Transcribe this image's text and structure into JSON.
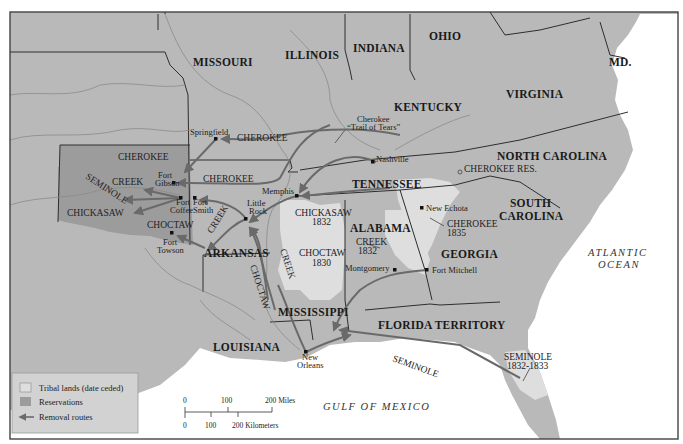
{
  "map": {
    "states": [
      {
        "id": "missouri",
        "label": "MISSOURI",
        "x": 193,
        "y": 66
      },
      {
        "id": "illinois",
        "label": "ILLINOIS",
        "x": 285,
        "y": 59
      },
      {
        "id": "indiana",
        "label": "INDIANA",
        "x": 353,
        "y": 52
      },
      {
        "id": "ohio",
        "label": "OHIO",
        "x": 429,
        "y": 40
      },
      {
        "id": "md",
        "label": "MD.",
        "x": 609,
        "y": 66
      },
      {
        "id": "kentucky",
        "label": "KENTUCKY",
        "x": 394,
        "y": 111
      },
      {
        "id": "virginia",
        "label": "VIRGINIA",
        "x": 506,
        "y": 98
      },
      {
        "id": "north-carolina",
        "label": "NORTH CAROLINA",
        "x": 497,
        "y": 160
      },
      {
        "id": "tennessee",
        "label": "TENNESSEE",
        "x": 352,
        "y": 188
      },
      {
        "id": "south-carolina-1",
        "label": "SOUTH",
        "x": 510,
        "y": 207
      },
      {
        "id": "south-carolina-2",
        "label": "CAROLINA",
        "x": 499,
        "y": 220
      },
      {
        "id": "alabama",
        "label": "ALABAMA",
        "x": 350,
        "y": 232
      },
      {
        "id": "georgia",
        "label": "GEORGIA",
        "x": 441,
        "y": 258
      },
      {
        "id": "arkansas",
        "label": "ARKANSAS",
        "x": 204,
        "y": 257
      },
      {
        "id": "mississippi",
        "label": "MISSISSIPPI",
        "x": 278,
        "y": 316
      },
      {
        "id": "florida-territory",
        "label": "FLORIDA TERRITORY",
        "x": 378,
        "y": 329
      },
      {
        "id": "louisiana",
        "label": "LOUISIANA",
        "x": 213,
        "y": 351
      }
    ],
    "tribes": [
      {
        "id": "cherokee-ok",
        "label": "CHEROKEE",
        "x": 118,
        "y": 160
      },
      {
        "id": "creek-ok",
        "label": "CREEK",
        "x": 112,
        "y": 185
      },
      {
        "id": "chickasaw-ok",
        "label": "CHICKASAW",
        "x": 67,
        "y": 216
      },
      {
        "id": "choctaw-ok",
        "label": "CHOCTAW",
        "x": 147,
        "y": 228
      },
      {
        "id": "chickasaw-1832",
        "label": "CHICKASAW",
        "x": 295,
        "y": 216
      },
      {
        "id": "chickasaw-1832-date",
        "label": "1832",
        "x": 312,
        "y": 225
      },
      {
        "id": "choctaw-1830",
        "label": "CHOCTAW",
        "x": 299,
        "y": 256
      },
      {
        "id": "choctaw-1830-date",
        "label": "1830",
        "x": 312,
        "y": 266
      },
      {
        "id": "creek-1832",
        "label": "CREEK",
        "x": 356,
        "y": 245
      },
      {
        "id": "creek-1832-date",
        "label": "1832",
        "x": 358,
        "y": 254
      },
      {
        "id": "cherokee-1835",
        "label": "CHEROKEE",
        "x": 447,
        "y": 227
      },
      {
        "id": "cherokee-1835-date",
        "label": "1835",
        "x": 447,
        "y": 236
      },
      {
        "id": "cherokee-res",
        "label": "CHEROKEE RES.",
        "x": 464,
        "y": 172
      },
      {
        "id": "seminole-1832",
        "label": "SEMINOLE",
        "x": 504,
        "y": 360
      },
      {
        "id": "seminole-1832-date",
        "label": "1832-1833",
        "x": 507,
        "y": 369
      }
    ],
    "routes": [
      {
        "id": "route-cherokee-springfield",
        "label": "CHEROKEE",
        "x": 237,
        "y": 141
      },
      {
        "id": "route-cherokee-gibson",
        "label": "CHEROKEE",
        "x": 203,
        "y": 182
      },
      {
        "id": "route-cherokee-trail-1",
        "label": "Cherokee",
        "x": 357,
        "y": 122
      },
      {
        "id": "route-cherokee-trail-2",
        "label": "“Trail of Tears”",
        "x": 347,
        "y": 130
      }
    ],
    "rotated_routes": [
      {
        "id": "route-seminole-ok",
        "label": "SEMINOLE",
        "x": 85,
        "y": 178,
        "angle": 33
      },
      {
        "id": "route-creek-ar",
        "label": "CREEK",
        "x": 212,
        "y": 234,
        "angle": -58
      },
      {
        "id": "route-creek-ms",
        "label": "CREEK",
        "x": 280,
        "y": 250,
        "angle": 72
      },
      {
        "id": "route-choctaw-ms",
        "label": "CHOCTAW",
        "x": 250,
        "y": 266,
        "angle": 72
      },
      {
        "id": "route-seminole-gulf",
        "label": "SEMINOLE",
        "x": 392,
        "y": 361,
        "angle": 20
      }
    ],
    "cities": [
      {
        "id": "springfield",
        "label": "Springfield",
        "x": 190,
        "y": 135,
        "dx": 216,
        "dy": 139
      },
      {
        "id": "nashville",
        "label": "Nashville",
        "x": 376,
        "y": 162,
        "dx": 373,
        "dy": 162
      },
      {
        "id": "memphis",
        "label": "Memphis",
        "x": 262,
        "y": 194,
        "dx": 297,
        "dy": 196
      },
      {
        "id": "fort-gibson-1",
        "label": "Fort",
        "x": 158,
        "y": 178,
        "dx": 174,
        "dy": 183
      },
      {
        "id": "fort-gibson-2",
        "label": "Gibson",
        "x": 155,
        "y": 186,
        "dx": null,
        "dy": null
      },
      {
        "id": "fort-coffee-1",
        "label": "Fort",
        "x": 176,
        "y": 201,
        "dx": 181,
        "dy": 198
      },
      {
        "id": "fort-coffee-2",
        "label": "Coffee",
        "x": 170,
        "y": 211,
        "dx": null,
        "dy": null
      },
      {
        "id": "fort-smith-1",
        "label": "Fort",
        "x": 193,
        "y": 201,
        "dx": 195,
        "dy": 198
      },
      {
        "id": "fort-smith-2",
        "label": "Smith",
        "x": 193,
        "y": 211,
        "dx": null,
        "dy": null
      },
      {
        "id": "little-rock-1",
        "label": "Little",
        "x": 247,
        "y": 206,
        "dx": 246,
        "dy": 219
      },
      {
        "id": "little-rock-2",
        "label": "Rock",
        "x": 249,
        "y": 214,
        "dx": null,
        "dy": null
      },
      {
        "id": "fort-towson-1",
        "label": "Fort",
        "x": 163,
        "y": 245,
        "dx": 172,
        "dy": 233
      },
      {
        "id": "fort-towson-2",
        "label": "Towson",
        "x": 157,
        "y": 253,
        "dx": null,
        "dy": null
      },
      {
        "id": "new-echota",
        "label": "New Echota",
        "x": 426,
        "y": 211,
        "dx": 422,
        "dy": 208
      },
      {
        "id": "montgomery",
        "label": "Montgomery",
        "x": 345,
        "y": 271,
        "dx": 395,
        "dy": 270
      },
      {
        "id": "fort-mitchell",
        "label": "Fort Mitchell",
        "x": 432,
        "y": 273,
        "dx": 427,
        "dy": 270
      },
      {
        "id": "new-orleans-1",
        "label": "New",
        "x": 302,
        "y": 359,
        "dx": 306,
        "dy": 352
      },
      {
        "id": "new-orleans-2",
        "label": "Orleans",
        "x": 297,
        "y": 367,
        "dx": null,
        "dy": null
      }
    ],
    "water": [
      {
        "id": "atlantic-ocean-1",
        "label": "ATLANTIC",
        "x": 588,
        "y": 256
      },
      {
        "id": "atlantic-ocean-2",
        "label": "OCEAN",
        "x": 598,
        "y": 268
      },
      {
        "id": "gulf-of-mexico",
        "label": "GULF OF MEXICO",
        "x": 323,
        "y": 410
      }
    ]
  },
  "legend": {
    "items": [
      {
        "id": "tribal-lands",
        "label": "Tribal lands (date ceded)",
        "swatch": "#dedede"
      },
      {
        "id": "reservations",
        "label": "Reservations",
        "swatch": "#9c9c9c"
      },
      {
        "id": "removal-routes",
        "label": "Removal routes",
        "swatch": "#6a6a6a"
      }
    ]
  },
  "scale": {
    "miles_labels": [
      "0",
      "100",
      "200 Miles"
    ],
    "km_labels": [
      "0",
      "100",
      "200 Kilometers"
    ]
  },
  "colors": {
    "land": "#b9b9b9",
    "tribal": "#dedede",
    "reservation": "#9c9c9c",
    "route": "#6a6a6a",
    "water": "#ffffff"
  }
}
